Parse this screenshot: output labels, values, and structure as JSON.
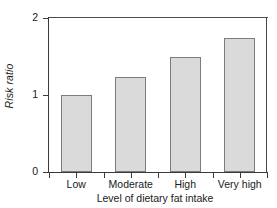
{
  "chart_data": {
    "type": "bar",
    "title": "",
    "categories": [
      "Low",
      "Moderate",
      "High",
      "Very high"
    ],
    "values": [
      1.0,
      1.23,
      1.49,
      1.74
    ],
    "xlabel": "Level of dietary fat intake",
    "ylabel": "Risk ratio",
    "ylim": [
      0,
      2
    ],
    "yticks": [
      "0",
      "1",
      "2"
    ],
    "ytick_values": [
      0,
      1,
      2
    ],
    "grid": false,
    "legend": null,
    "bar_fill_color": "#dadada",
    "bar_border_color": "#7c7c7c",
    "axis_color": "#3a3a3a",
    "background_color": "#ffffff"
  },
  "axes": {
    "y_title": "Risk ratio",
    "x_title": "Level of dietary fat intake",
    "y_tick_labels": [
      "2",
      "1",
      "0"
    ]
  }
}
